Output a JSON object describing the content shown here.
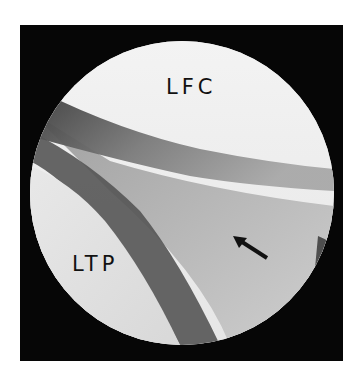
{
  "figure": {
    "type": "arthroscopic-view",
    "labels": [
      {
        "id": "lfc",
        "text": "LFC"
      },
      {
        "id": "ltp",
        "text": "LTP"
      }
    ],
    "arrow": {
      "direction": "up-left"
    },
    "colors": {
      "frame": "#060606",
      "background": "#ffffff",
      "condyle": "#ececec",
      "plateau": "#e0e0e0",
      "shadow": "#4a4a4a",
      "meniscus": "#c4c4c4"
    }
  }
}
